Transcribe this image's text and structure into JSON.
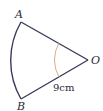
{
  "diagram": {
    "type": "sector",
    "points": {
      "A": {
        "label": "A"
      },
      "B": {
        "label": "B"
      },
      "O": {
        "label": "O"
      }
    },
    "radius_label": "9cm",
    "colors": {
      "stroke": "#3a3a5a",
      "angle_arc": "#d9a070",
      "text": "#2a2a3a"
    }
  }
}
